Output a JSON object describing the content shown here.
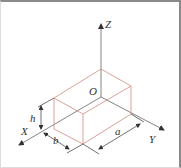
{
  "diagram": {
    "title": "",
    "axes": {
      "z_label": "Z",
      "x_label": "X",
      "y_label": "Y",
      "origin_label": "O"
    },
    "dimensions": {
      "length_label": "a",
      "width_label": "b",
      "height_label": "h"
    },
    "colors": {
      "axis": "#555555",
      "box_edge": "#d08a80",
      "dimension": "#333333",
      "border": "#8a8a8a"
    }
  }
}
